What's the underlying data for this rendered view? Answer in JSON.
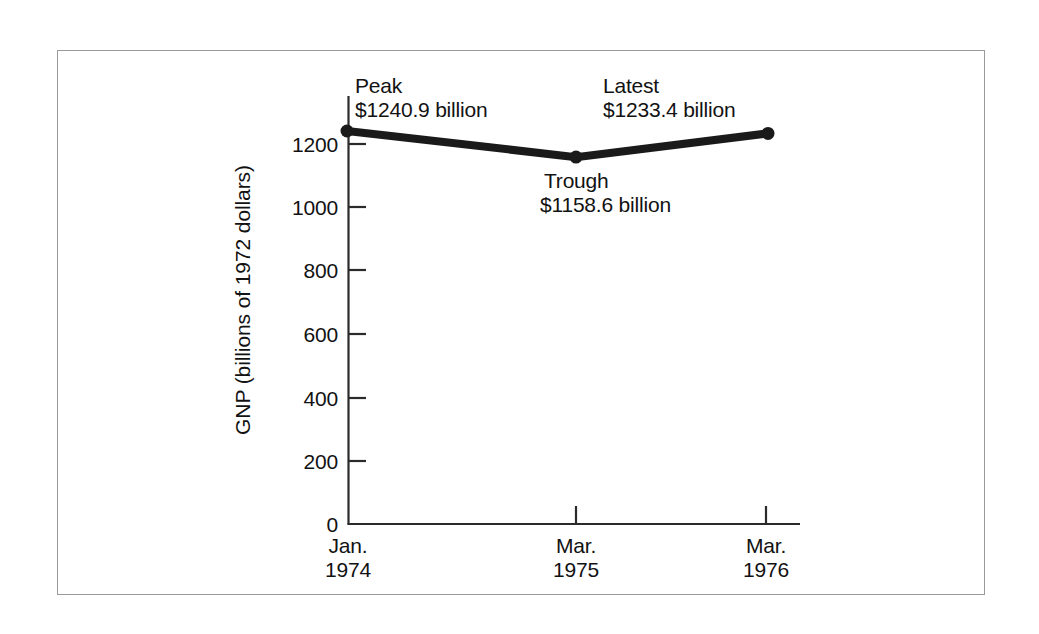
{
  "chart_data": {
    "type": "line",
    "title": "",
    "subtitle": "",
    "xlabel": "",
    "ylabel": "GNP (billions of 1972 dollars)",
    "x": [
      "Jan. 1974",
      "Mar. 1975",
      "Mar. 1976"
    ],
    "categories": [
      "Jan.\n1974",
      "Mar.\n1975",
      "Mar.\n1976"
    ],
    "values": [
      1240.9,
      1158.6,
      1233.4
    ],
    "series": [
      {
        "name": "GNP",
        "values": [
          1240.9,
          1158.6,
          1233.4
        ]
      }
    ],
    "point_labels": [
      "Peak",
      "Trough",
      "Latest"
    ],
    "ylim": [
      0,
      1300
    ],
    "yticks": [
      0,
      200,
      400,
      600,
      800,
      1000,
      1200
    ],
    "ytick_labels": [
      "0",
      "200",
      "400",
      "600",
      "800",
      "1000",
      "1200"
    ],
    "xtick_labels": [
      {
        "line1": "Jan.",
        "line2": "1974"
      },
      {
        "line1": "Mar.",
        "line2": "1975"
      },
      {
        "line1": "Mar.",
        "line2": "1976"
      }
    ],
    "grid": false,
    "legend": "none",
    "line_color": "#1a1a1a",
    "marker_color": "#1a1a1a",
    "axis_color": "#2b2b2b",
    "background_color": "#ffffff",
    "frame_color": "#9a9a9a"
  },
  "axis": {
    "y_title": "GNP (billions of 1972 dollars)",
    "y_ticks": [
      {
        "label": "1200",
        "value": 1200
      },
      {
        "label": "1000",
        "value": 1000
      },
      {
        "label": "800",
        "value": 800
      },
      {
        "label": "600",
        "value": 600
      },
      {
        "label": "400",
        "value": 400
      },
      {
        "label": "200",
        "value": 200
      },
      {
        "label": "0",
        "value": 0
      }
    ],
    "x_ticks": [
      {
        "line1": "Jan.",
        "line2": "1974"
      },
      {
        "line1": "Mar.",
        "line2": "1975"
      },
      {
        "line1": "Mar.",
        "line2": "1976"
      }
    ]
  },
  "annotations": {
    "peak": {
      "label": "Peak",
      "value": "$1240.9 billion"
    },
    "trough": {
      "label": "Trough",
      "value": "$1158.6 billion"
    },
    "latest": {
      "label": "Latest",
      "value": "$1233.4 billion"
    }
  }
}
